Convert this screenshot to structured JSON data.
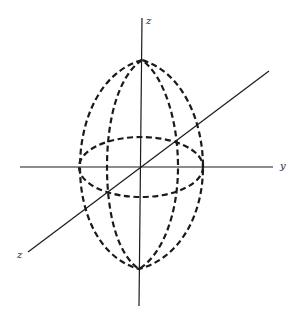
{
  "figure": {
    "axes": {
      "z_top_label": "z",
      "y_label": "y",
      "x_label": "z"
    },
    "colors": {
      "line": "#1a1a1a",
      "background": "#ffffff"
    }
  }
}
